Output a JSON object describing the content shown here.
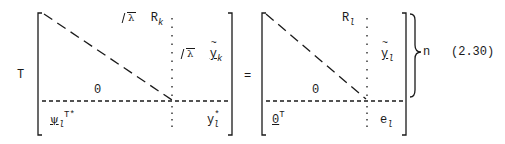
{
  "equation": {
    "number": "(2.30)",
    "left_factor": "T",
    "equals": "=",
    "brace_label": "n",
    "lhs_matrix": {
      "top_right_block": {
        "sqrt_arg": "λ",
        "symbol": "R",
        "subscript": "k"
      },
      "right_column_block": {
        "sqrt_arg": "λ",
        "symbol": "y",
        "subscript": "k",
        "accent": "tilde",
        "underlined": true
      },
      "lower_triangle": "0",
      "bottom_left": {
        "symbol": "ψ",
        "subscript": "l",
        "superscript": "T*",
        "underlined": true
      },
      "bottom_right": {
        "symbol": "y",
        "subscript": "l",
        "superscript": "*"
      }
    },
    "rhs_matrix": {
      "top_right_block": {
        "symbol": "R",
        "subscript": "l"
      },
      "right_column_block": {
        "symbol": "y",
        "subscript": "l",
        "accent": "tilde",
        "underlined": true
      },
      "lower_triangle": "0",
      "bottom_left": {
        "symbol": "0",
        "superscript": "T",
        "underlined": true
      },
      "bottom_right": {
        "symbol": "e",
        "subscript": "l"
      }
    }
  }
}
